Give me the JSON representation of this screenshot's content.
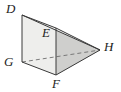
{
  "figure": {
    "type": "geometry-diagram",
    "canvas": {
      "width": 121,
      "height": 92,
      "background": "#ffffff"
    },
    "colors": {
      "outline": "#3a3a3a",
      "hidden_edge": "#6e6e6e",
      "face_left": "#eeeeec",
      "face_front": "#e2e2e0",
      "face_top": "#f4f4f2",
      "face_right": "#cfcfcd",
      "label": "#1d1d1d"
    },
    "vertices": [
      {
        "name": "D",
        "x": 22,
        "y": 15,
        "label": "D",
        "label_x": 6,
        "label_y": 2
      },
      {
        "name": "E",
        "x": 56,
        "y": 28,
        "label": "E",
        "label_x": 42,
        "label_y": 26
      },
      {
        "name": "G",
        "x": 22,
        "y": 62,
        "label": "G",
        "label_x": 4,
        "label_y": 55
      },
      {
        "name": "F",
        "x": 56,
        "y": 75,
        "label": "F",
        "label_x": 52,
        "label_y": 77
      },
      {
        "name": "H",
        "x": 100,
        "y": 50,
        "label": "H",
        "label_x": 104,
        "label_y": 40
      }
    ],
    "edges": [
      {
        "from": "D",
        "to": "E",
        "style": "solid"
      },
      {
        "from": "D",
        "to": "H",
        "style": "solid"
      },
      {
        "from": "E",
        "to": "H",
        "style": "solid"
      },
      {
        "from": "D",
        "to": "G",
        "style": "solid"
      },
      {
        "from": "E",
        "to": "F",
        "style": "solid"
      },
      {
        "from": "G",
        "to": "F",
        "style": "solid"
      },
      {
        "from": "F",
        "to": "H",
        "style": "solid"
      },
      {
        "from": "G",
        "to": "H",
        "style": "dashed"
      }
    ],
    "faces": [
      {
        "name": "face-left-DEFG",
        "points": "22,15 56,28 56,75 22,62",
        "fill": "#eeeeec"
      },
      {
        "name": "face-top-DEH",
        "points": "22,15 56,28 100,50",
        "fill": "#f4f4f2"
      },
      {
        "name": "face-right-EFH",
        "points": "56,28 56,75 100,50",
        "fill": "#cfcfcd"
      },
      {
        "name": "face-bottom-GFH",
        "points": "22,62 56,75 100,50",
        "fill": "#dcdcda"
      }
    ]
  }
}
